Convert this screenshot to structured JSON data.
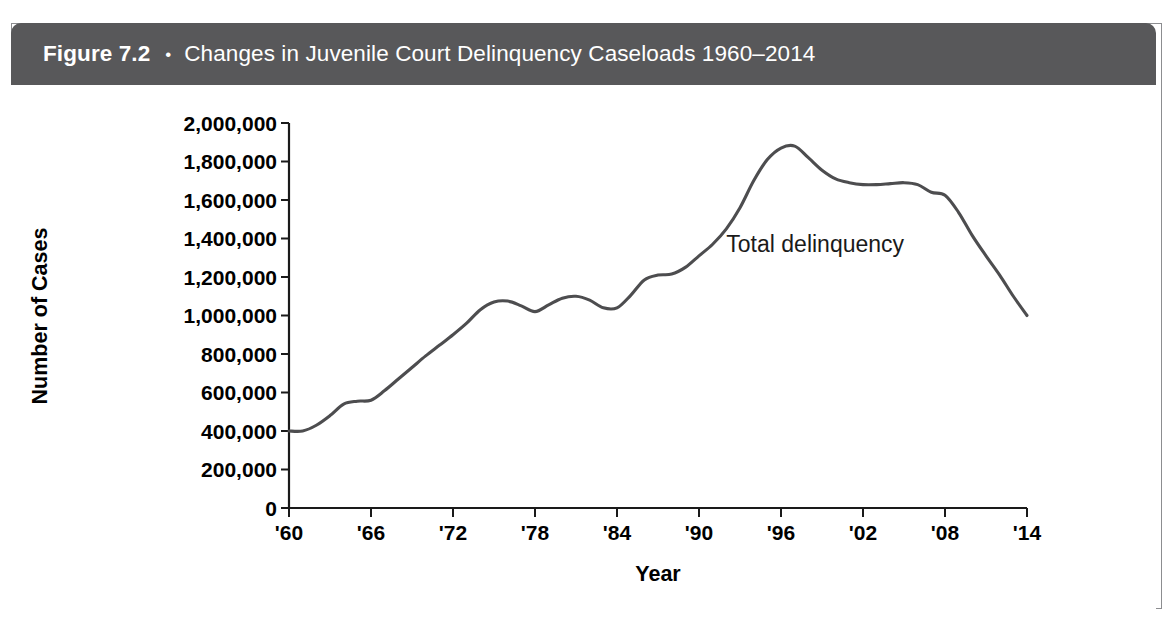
{
  "figure": {
    "label": "Figure 7.2",
    "bullet": "•",
    "title": "Changes in Juvenile Court Delinquency Caseloads 1960–2014",
    "header_bg": "#58585a",
    "header_text_color": "#ffffff",
    "frame_border_color": "#8c8d90",
    "background": "#ffffff"
  },
  "chart_data": {
    "type": "line",
    "title": "Changes in Juvenile Court Delinquency Caseloads 1960–2014",
    "xlabel": "Year",
    "ylabel": "Number of Cases",
    "xlim": [
      1960,
      2014
    ],
    "ylim": [
      0,
      2000000
    ],
    "grid": false,
    "legend_position": "inline-annotation",
    "line_color": "#4d4d4f",
    "annotations": [
      {
        "text": "Total delinquency",
        "x": 1992,
        "y": 1330000
      }
    ],
    "y_ticks": [
      0,
      200000,
      400000,
      600000,
      800000,
      1000000,
      1200000,
      1400000,
      1600000,
      1800000,
      2000000
    ],
    "y_tick_labels": [
      "0",
      "200,000",
      "400,000",
      "600,000",
      "800,000",
      "1,000,000",
      "1,200,000",
      "1,400,000",
      "1,600,000",
      "1,800,000",
      "2,000,000"
    ],
    "x_ticks": [
      1960,
      1966,
      1972,
      1978,
      1984,
      1990,
      1996,
      2002,
      2008,
      2014
    ],
    "x_tick_labels": [
      "'60",
      "'66",
      "'72",
      "'78",
      "'84",
      "'90",
      "'96",
      "'02",
      "'08",
      "'14"
    ],
    "series": [
      {
        "name": "Total delinquency",
        "x": [
          1960,
          1961,
          1962,
          1963,
          1964,
          1965,
          1966,
          1967,
          1968,
          1969,
          1970,
          1971,
          1972,
          1973,
          1974,
          1975,
          1976,
          1977,
          1978,
          1979,
          1980,
          1981,
          1982,
          1983,
          1984,
          1985,
          1986,
          1987,
          1988,
          1989,
          1990,
          1991,
          1992,
          1993,
          1994,
          1995,
          1996,
          1997,
          1998,
          1999,
          2000,
          2001,
          2002,
          2003,
          2004,
          2005,
          2006,
          2007,
          2008,
          2009,
          2010,
          2011,
          2012,
          2013,
          2014
        ],
        "values": [
          400000,
          400000,
          430000,
          480000,
          540000,
          555000,
          560000,
          610000,
          670000,
          730000,
          790000,
          845000,
          900000,
          960000,
          1030000,
          1070000,
          1075000,
          1050000,
          1020000,
          1055000,
          1090000,
          1100000,
          1080000,
          1040000,
          1040000,
          1105000,
          1185000,
          1210000,
          1215000,
          1250000,
          1310000,
          1370000,
          1450000,
          1560000,
          1700000,
          1810000,
          1870000,
          1880000,
          1820000,
          1755000,
          1710000,
          1690000,
          1680000,
          1680000,
          1685000,
          1690000,
          1680000,
          1640000,
          1625000,
          1535000,
          1415000,
          1310000,
          1210000,
          1100000,
          1000000
        ]
      }
    ]
  }
}
